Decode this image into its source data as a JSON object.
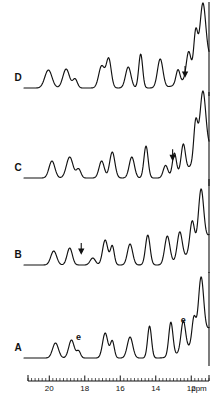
{
  "figure": {
    "kind": "nmr-spectrum-stack",
    "background_color": "#ffffff",
    "line_color": "#111111",
    "width": 222,
    "height": 410
  },
  "axis": {
    "label": "ppm",
    "unit_text": "ppm",
    "direction": "reversed",
    "min_ppm": 11.0,
    "max_ppm": 21.2,
    "major_ticks": [
      20,
      18,
      16,
      14,
      12
    ],
    "major_tick_labels": [
      "20",
      "18",
      "16",
      "14",
      "12"
    ],
    "minor_tick_step": 0.2,
    "tick_label_0": "20",
    "tick_label_1": "18",
    "tick_label_2": "16",
    "tick_label_3": "14",
    "tick_label_4": "12"
  },
  "traces": [
    {
      "id": "D",
      "label": "D",
      "baseline_y": 88,
      "annotations": [
        {
          "type": "arrow-down",
          "label": "",
          "ppm": 12.35
        }
      ]
    },
    {
      "id": "C",
      "label": "C",
      "baseline_y": 178,
      "annotations": [
        {
          "type": "arrow-down",
          "label": "",
          "ppm": 13.05
        }
      ]
    },
    {
      "id": "B",
      "label": "B",
      "baseline_y": 265,
      "annotations": [
        {
          "type": "arrow-down",
          "label": "",
          "ppm": 18.2
        }
      ]
    },
    {
      "id": "A",
      "label": "A",
      "baseline_y": 358,
      "annotations": [
        {
          "type": "letter",
          "label": "e",
          "ppm": 18.35
        },
        {
          "type": "letter",
          "label": "e",
          "ppm": 12.45
        }
      ]
    }
  ],
  "chart_data": {
    "type": "line",
    "title": "",
    "xlabel": "ppm",
    "ylabel": "",
    "xlim": [
      21.2,
      11.0
    ],
    "grid": false,
    "legend": "none",
    "x_axis_reversed": true,
    "series": [
      {
        "name": "D",
        "baseline_y": 88,
        "peaks": [
          {
            "ppm": 20.05,
            "height": 18,
            "width": 0.55
          },
          {
            "ppm": 19.05,
            "height": 19,
            "width": 0.5
          },
          {
            "ppm": 18.55,
            "height": 9,
            "width": 0.35
          },
          {
            "ppm": 17.05,
            "height": 22,
            "width": 0.45
          },
          {
            "ppm": 16.65,
            "height": 29,
            "width": 0.38
          },
          {
            "ppm": 15.55,
            "height": 21,
            "width": 0.42
          },
          {
            "ppm": 14.85,
            "height": 34,
            "width": 0.3
          },
          {
            "ppm": 13.75,
            "height": 29,
            "width": 0.42
          },
          {
            "ppm": 12.75,
            "height": 14,
            "width": 0.3
          },
          {
            "ppm": 12.15,
            "height": 26,
            "width": 0.35
          },
          {
            "ppm": 11.75,
            "height": 40,
            "width": 0.3
          },
          {
            "ppm": 11.35,
            "height": 62,
            "width": 0.45
          }
        ]
      },
      {
        "name": "C",
        "baseline_y": 178,
        "peaks": [
          {
            "ppm": 19.85,
            "height": 17,
            "width": 0.45
          },
          {
            "ppm": 18.85,
            "height": 21,
            "width": 0.5
          },
          {
            "ppm": 18.35,
            "height": 9,
            "width": 0.35
          },
          {
            "ppm": 17.05,
            "height": 17,
            "width": 0.4
          },
          {
            "ppm": 16.45,
            "height": 26,
            "width": 0.4
          },
          {
            "ppm": 15.35,
            "height": 21,
            "width": 0.4
          },
          {
            "ppm": 14.55,
            "height": 32,
            "width": 0.32
          },
          {
            "ppm": 13.45,
            "height": 12,
            "width": 0.35
          },
          {
            "ppm": 12.95,
            "height": 22,
            "width": 0.3
          },
          {
            "ppm": 12.45,
            "height": 27,
            "width": 0.32
          },
          {
            "ppm": 11.75,
            "height": 40,
            "width": 0.3
          },
          {
            "ppm": 11.35,
            "height": 64,
            "width": 0.45
          }
        ]
      },
      {
        "name": "B",
        "baseline_y": 265,
        "peaks": [
          {
            "ppm": 19.75,
            "height": 14,
            "width": 0.45
          },
          {
            "ppm": 18.85,
            "height": 17,
            "width": 0.4
          },
          {
            "ppm": 17.55,
            "height": 7,
            "width": 0.4
          },
          {
            "ppm": 16.85,
            "height": 25,
            "width": 0.4
          },
          {
            "ppm": 16.45,
            "height": 19,
            "width": 0.3
          },
          {
            "ppm": 15.45,
            "height": 21,
            "width": 0.4
          },
          {
            "ppm": 14.45,
            "height": 30,
            "width": 0.35
          },
          {
            "ppm": 13.35,
            "height": 28,
            "width": 0.4
          },
          {
            "ppm": 12.65,
            "height": 28,
            "width": 0.38
          },
          {
            "ppm": 11.95,
            "height": 31,
            "width": 0.35
          },
          {
            "ppm": 11.45,
            "height": 55,
            "width": 0.4
          }
        ]
      },
      {
        "name": "A",
        "baseline_y": 358,
        "peaks": [
          {
            "ppm": 19.65,
            "height": 15,
            "width": 0.45
          },
          {
            "ppm": 18.75,
            "height": 18,
            "width": 0.42
          },
          {
            "ppm": 18.35,
            "height": 7,
            "width": 0.3
          },
          {
            "ppm": 16.85,
            "height": 25,
            "width": 0.4
          },
          {
            "ppm": 16.45,
            "height": 17,
            "width": 0.3
          },
          {
            "ppm": 15.45,
            "height": 21,
            "width": 0.42
          },
          {
            "ppm": 14.35,
            "height": 32,
            "width": 0.3
          },
          {
            "ppm": 13.15,
            "height": 34,
            "width": 0.32
          },
          {
            "ppm": 12.45,
            "height": 30,
            "width": 0.35
          },
          {
            "ppm": 11.85,
            "height": 26,
            "width": 0.3
          },
          {
            "ppm": 11.45,
            "height": 60,
            "width": 0.4
          }
        ]
      }
    ]
  }
}
